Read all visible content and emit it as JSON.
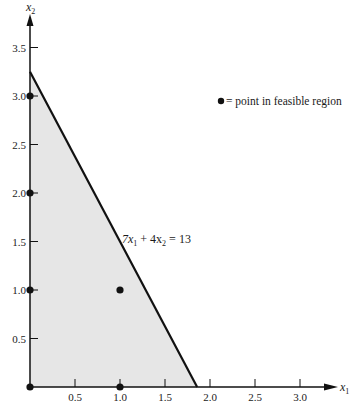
{
  "chart_data": {
    "type": "area",
    "title": "",
    "xlabel": "x1",
    "ylabel": "x2",
    "xlim": [
      0,
      3.3
    ],
    "ylim": [
      0,
      3.8
    ],
    "grid": false,
    "x_ticks": [
      0.5,
      1.0,
      1.5,
      2.0,
      2.5,
      3.0
    ],
    "x_tick_labels": [
      "0.5",
      "1.0",
      "1.5",
      "2.0",
      "2.5",
      "3.0"
    ],
    "y_ticks": [
      0.5,
      1.0,
      1.5,
      2.0,
      2.5,
      3.0,
      3.5
    ],
    "y_tick_labels": [
      "0.5",
      "1.0",
      "1.5",
      "2.0",
      "2.5",
      "3.0",
      "3.5"
    ],
    "constraint": {
      "label": "7x1 + 4x2 = 13",
      "coef_x1": 7,
      "coef_x2": 4,
      "rhs": 13,
      "intercepts": [
        [
          0,
          3.25
        ],
        [
          1.857,
          0
        ]
      ]
    },
    "feasible_region": {
      "vertices": [
        [
          0,
          0
        ],
        [
          0,
          3.25
        ],
        [
          1.857,
          0
        ]
      ],
      "fill": "#e6e6e6"
    },
    "points": [
      {
        "x": 0,
        "y": 0
      },
      {
        "x": 0,
        "y": 1
      },
      {
        "x": 0,
        "y": 2
      },
      {
        "x": 0,
        "y": 3
      },
      {
        "x": 1,
        "y": 0
      },
      {
        "x": 1,
        "y": 1
      }
    ],
    "legend": {
      "marker": "●",
      "text": "= point in feasible region",
      "position": "upper right"
    }
  },
  "labels": {
    "x_axis": "x",
    "x_axis_sub": "1",
    "y_axis": "x",
    "y_axis_sub": "2",
    "eq_7": "7x",
    "eq_sub1": "1",
    "eq_mid": " + 4x",
    "eq_sub2": "2",
    "eq_end": " = 13",
    "legend_text": "= point in feasible region"
  }
}
